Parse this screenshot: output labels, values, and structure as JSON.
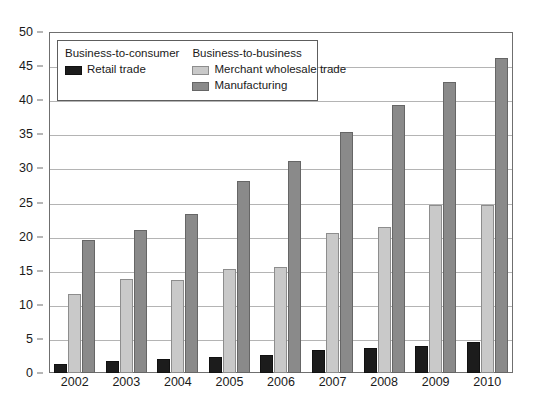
{
  "chart_data": {
    "type": "bar",
    "title": "",
    "subtitle": "",
    "xlabel": "",
    "ylabel": "",
    "categories": [
      "2002",
      "2003",
      "2004",
      "2005",
      "2006",
      "2007",
      "2008",
      "2009",
      "2010"
    ],
    "series": [
      {
        "name": "Retail trade",
        "group": "Business-to-consumer",
        "color": "#1c1c1c",
        "values": [
          1.3,
          1.7,
          2.1,
          2.4,
          2.7,
          3.4,
          3.6,
          4.0,
          4.5
        ]
      },
      {
        "name": "Merchant wholesale trade",
        "group": "Business-to-business",
        "color": "#c9c9c9",
        "values": [
          11.6,
          13.8,
          13.7,
          15.3,
          15.6,
          20.6,
          21.4,
          24.6,
          24.7
        ]
      },
      {
        "name": "Manufacturing",
        "group": "Business-to-business",
        "color": "#8a8a8a",
        "values": [
          19.5,
          21.0,
          23.3,
          28.1,
          31.1,
          35.3,
          39.3,
          42.7,
          46.2
        ]
      }
    ],
    "ylim": [
      0,
      50
    ],
    "ytick_step": 5,
    "yticks": [
      0,
      5,
      10,
      15,
      20,
      25,
      30,
      35,
      40,
      45,
      50
    ],
    "ytick_labels": [
      "0",
      "5",
      "10",
      "15",
      "20",
      "25",
      "30",
      "35",
      "40",
      "45",
      "50"
    ],
    "grid": true,
    "grid_axis": "y",
    "legend_position": "upper-left-inside"
  },
  "legend": {
    "columns": [
      {
        "heading": "Business-to-consumer",
        "entries": [
          {
            "label": "Retail trade",
            "swatch": "retail-swatch-icon"
          }
        ]
      },
      {
        "heading": "Business-to-business",
        "entries": [
          {
            "label": "Merchant wholesale trade",
            "swatch": "wholesale-swatch-icon"
          },
          {
            "label": "Manufacturing",
            "swatch": "manufacturing-swatch-icon"
          }
        ]
      }
    ]
  },
  "colors": {
    "retail": "#1c1c1c",
    "wholesale": "#c9c9c9",
    "manufacturing": "#8a8a8a",
    "gridline": "#b4b4b4",
    "frame": "#6f6f6f",
    "background": "#ffffff"
  }
}
